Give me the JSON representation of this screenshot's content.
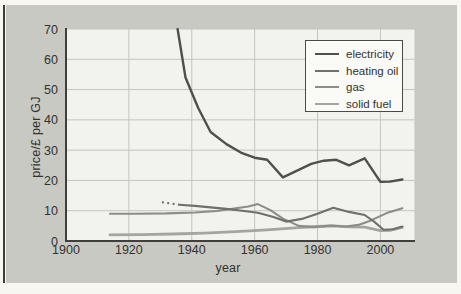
{
  "figure": {
    "xlabel": "year",
    "ylabel": "price/£ per GJ"
  },
  "colors": {
    "page_bg": "#f7f6f0",
    "panel_bg": "#c8c9c3",
    "plot_bg": "#f2f2ee",
    "grid": "#c4c5c0",
    "axis": "#403f3b",
    "text": "#33322e",
    "legend_bg": "#fafaf7",
    "legend_border": "#4a4a48",
    "left_border": "#3d3d38"
  },
  "chart_data": {
    "type": "line",
    "title": "",
    "xlabel": "year",
    "ylabel": "price/£ per GJ",
    "xlim": [
      1900,
      2011
    ],
    "ylim": [
      0,
      70
    ],
    "x_ticks": [
      1900,
      1920,
      1940,
      1960,
      1980,
      2000
    ],
    "y_ticks": [
      0,
      10,
      20,
      30,
      40,
      50,
      60,
      70
    ],
    "grid": true,
    "legend_position": "upper right",
    "series": [
      {
        "name": "electricity",
        "color": "#4f4f4d",
        "width": 2.4,
        "points": [
          [
            1935.5,
            70
          ],
          [
            1938,
            54
          ],
          [
            1942,
            44
          ],
          [
            1946,
            36
          ],
          [
            1951,
            32
          ],
          [
            1956,
            29
          ],
          [
            1960,
            27.5
          ],
          [
            1964,
            26.8
          ],
          [
            1969,
            21
          ],
          [
            1974,
            23.5
          ],
          [
            1978,
            25.5
          ],
          [
            1982,
            26.5
          ],
          [
            1986,
            26.8
          ],
          [
            1990,
            25
          ],
          [
            1995,
            27.3
          ],
          [
            2000,
            19.5
          ],
          [
            2003,
            19.6
          ],
          [
            2007,
            20.3
          ]
        ]
      },
      {
        "name": "heating oil",
        "color": "#6f6f6d",
        "width": 2.1,
        "dotted_points": [
          [
            1930.5,
            12.8
          ],
          [
            1933,
            12.4
          ],
          [
            1936,
            12.0
          ]
        ],
        "points": [
          [
            1936,
            12.0
          ],
          [
            1941,
            11.6
          ],
          [
            1946,
            11.1
          ],
          [
            1951,
            10.6
          ],
          [
            1956,
            10.0
          ],
          [
            1961,
            9.3
          ],
          [
            1966,
            7.9
          ],
          [
            1970,
            6.4
          ],
          [
            1975,
            7.3
          ],
          [
            1980,
            9.0
          ],
          [
            1985,
            11.0
          ],
          [
            1990,
            9.6
          ],
          [
            1995,
            8.6
          ],
          [
            1998,
            6.4
          ],
          [
            2001,
            3.7
          ],
          [
            2004,
            3.9
          ],
          [
            2007,
            4.8
          ]
        ]
      },
      {
        "name": "gas",
        "color": "#8c8c8a",
        "width": 2.1,
        "points": [
          [
            1914,
            9.0
          ],
          [
            1922,
            9.0
          ],
          [
            1932,
            9.1
          ],
          [
            1941,
            9.4
          ],
          [
            1948,
            9.9
          ],
          [
            1954,
            10.8
          ],
          [
            1958,
            11.4
          ],
          [
            1961,
            12.2
          ],
          [
            1965,
            10.2
          ],
          [
            1969,
            7.4
          ],
          [
            1974,
            5.0
          ],
          [
            1979,
            4.6
          ],
          [
            1984,
            5.1
          ],
          [
            1989,
            4.8
          ],
          [
            1993,
            5.3
          ],
          [
            1997,
            6.8
          ],
          [
            2002,
            9.2
          ],
          [
            2007,
            10.8
          ]
        ]
      },
      {
        "name": "solid fuel",
        "color": "#a4a4a2",
        "width": 2.8,
        "points": [
          [
            1914,
            2.0
          ],
          [
            1924,
            2.1
          ],
          [
            1934,
            2.3
          ],
          [
            1944,
            2.6
          ],
          [
            1954,
            3.1
          ],
          [
            1964,
            3.7
          ],
          [
            1974,
            4.4
          ],
          [
            1980,
            4.8
          ],
          [
            1985,
            5.0
          ],
          [
            1990,
            4.7
          ],
          [
            1995,
            4.6
          ],
          [
            2000,
            3.4
          ],
          [
            2003,
            3.5
          ],
          [
            2007,
            4.5
          ]
        ]
      }
    ]
  }
}
